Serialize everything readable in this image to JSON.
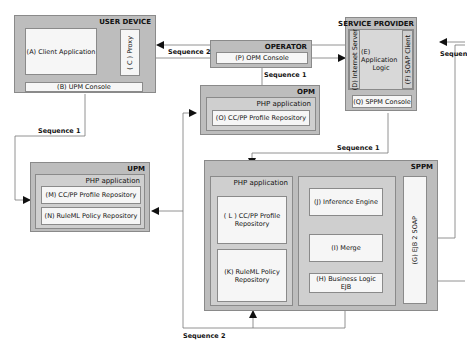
{
  "user_device": {
    "title": "USER DEVICE",
    "client_app": "(A) Client Application",
    "proxy": "( C ) Proxy",
    "upm_console": "(B) UPM Console"
  },
  "operator": {
    "title": "OPERATOR",
    "opm_console": "(P) OPM Console"
  },
  "service_provider": {
    "title": "SERVICE PROVIDER",
    "internet_server": "(D) Internet Server",
    "app_logic_line1": "(E) Application",
    "app_logic_line2": "Logic",
    "soap_client": "(F) SOAP Client",
    "sppm_console": "(Q) SPPM Console"
  },
  "opm": {
    "title": "OPM",
    "php_app": "PHP application",
    "profile_repo": "(O) CC/PP Profile Repository"
  },
  "upm": {
    "title": "UPM",
    "php_app": "PHP application",
    "profile_repo": "(M) CC/PP Profile Repository",
    "policy_repo": "(N) RuleML Policy Repository"
  },
  "sppm": {
    "title": "SPPM",
    "php_app": "PHP application",
    "profile_repo_line1": "( L ) CC/PP Profile",
    "profile_repo_line2": "Repository",
    "policy_repo_line1": "(K) RuleML Policy",
    "policy_repo_line2": "Repository",
    "inference_engine": "(J) Inference Engine",
    "merge": "(I) Merge",
    "business_logic": "(H) Business Logic EJB",
    "ejb2soap": "(G) EJB 2 SOAP"
  },
  "sequences": {
    "seq2_top": "Sequence 2",
    "seq1_operator": "Sequence 1",
    "seq1_upm": "Sequence 1",
    "seq1_sppm": "Sequence 1",
    "seq2_bottom": "Sequence 2",
    "seq_right_partial": "Sequen"
  }
}
